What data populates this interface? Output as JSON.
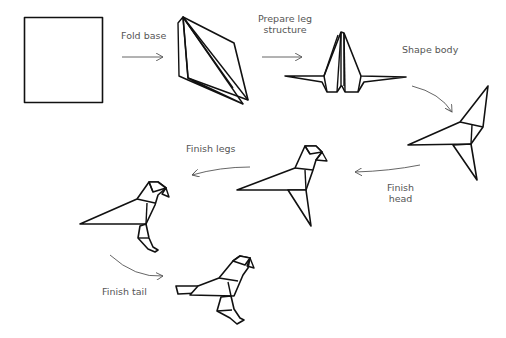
{
  "steps": [
    {
      "id": 1,
      "label": "Square paper"
    },
    {
      "id": 2,
      "label": "Fold base"
    },
    {
      "id": 3,
      "label": "Prepare leg structure"
    },
    {
      "id": 4,
      "label": "Shape body"
    },
    {
      "id": 5,
      "label": "Finish head"
    },
    {
      "id": 6,
      "label": "Finish legs"
    },
    {
      "id": 7,
      "label": "Finish tail"
    }
  ],
  "labels": {
    "fold_base": "Fold base",
    "prepare_leg_line1": "Prepare leg",
    "prepare_leg_line2": "structure",
    "shape_body": "Shape body",
    "finish_head_line1": "Finish",
    "finish_head_line2": "head",
    "finish_legs": "Finish legs",
    "finish_tail": "Finish tail"
  },
  "colors": {
    "line": "#111111",
    "arrow": "#555555",
    "text": "#555555",
    "background": "#ffffff"
  }
}
